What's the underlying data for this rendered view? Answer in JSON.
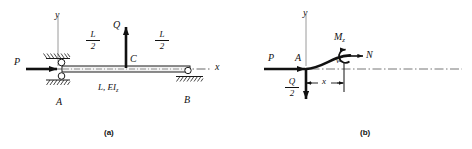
{
  "figure": {
    "ink_color": "#111111",
    "axis_color": "#8b8b8b",
    "hatch_color": "#333333"
  },
  "panel_a": {
    "caption": "(a)",
    "axis_y_label": "y",
    "axis_x_label": "x",
    "load_axial_label": "P",
    "load_transverse_label": "Q",
    "node_left_label": "A",
    "node_mid_label": "C",
    "node_right_label": "B",
    "beam_property_label": "L, EI",
    "beam_property_sub": "z",
    "span_left": {
      "numerator": "L",
      "denominator": "2"
    },
    "span_right": {
      "numerator": "L",
      "denominator": "2"
    }
  },
  "panel_b": {
    "caption": "(b)",
    "axis_y_label": "y",
    "load_axial_label": "P",
    "node_label": "A",
    "moment_label": "M",
    "moment_sub": "z",
    "normal_force_label": "N",
    "deflection_label": "v",
    "distance_label": "x",
    "reaction": {
      "numerator": "Q",
      "denominator": "2"
    }
  }
}
